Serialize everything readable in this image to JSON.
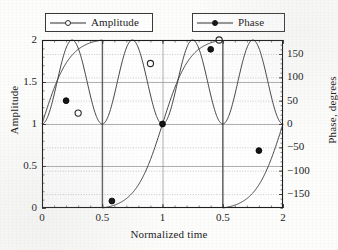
{
  "legend": {
    "items": [
      {
        "label": "Amplitude",
        "marker": "open-circle-marker",
        "color": "#2f2f2f"
      },
      {
        "label": "Phase",
        "marker": "filled-circle-marker",
        "color": "#151515"
      }
    ]
  },
  "axes": {
    "x": {
      "title": "Normalized time",
      "ticks": [
        {
          "value": 0,
          "label": "0"
        },
        {
          "value": 0.5,
          "label": "0.5"
        },
        {
          "value": 1,
          "label": "1"
        },
        {
          "value": 1.5,
          "label": "0.5"
        },
        {
          "value": 2,
          "label": "2"
        }
      ]
    },
    "y_left": {
      "title": "Amplitude",
      "ticks": [
        {
          "value": 0,
          "label": "0"
        },
        {
          "value": 0.5,
          "label": "0.5"
        },
        {
          "value": 1,
          "label": "1"
        },
        {
          "value": 1.5,
          "label": "1.5"
        },
        {
          "value": 2,
          "label": "2"
        }
      ]
    },
    "y_right": {
      "title": "Phase, degrees",
      "ticks": [
        {
          "value": -150,
          "label": "−150"
        },
        {
          "value": -100,
          "label": "−100"
        },
        {
          "value": -50,
          "label": "−50"
        },
        {
          "value": 0,
          "label": "0"
        },
        {
          "value": 50,
          "label": "50"
        },
        {
          "value": 100,
          "label": "100"
        },
        {
          "value": 150,
          "label": "150"
        }
      ]
    }
  },
  "chart_data": {
    "type": "line",
    "title": "",
    "subtitle": "",
    "xlabel": "Normalized time",
    "ylabel": "Amplitude",
    "y2label": "Phase, degrees",
    "xlim": [
      0,
      2
    ],
    "ylim": [
      0,
      2
    ],
    "y2lim": [
      -180,
      180
    ],
    "grid": true,
    "legend_position": "above-plot",
    "xticks": [
      0,
      0.5,
      1,
      1.5,
      2
    ],
    "xticklabels": [
      "0",
      "0.5",
      "1",
      "0.5",
      "2"
    ],
    "yticks": [
      0,
      0.5,
      1,
      1.5,
      2
    ],
    "yticklabels": [
      "0",
      "0.5",
      "1",
      "1.5",
      "2"
    ],
    "y2ticks": [
      -150,
      -100,
      -50,
      0,
      50,
      100,
      150
    ],
    "y2ticklabels": [
      "−150",
      "−100",
      "−50",
      "0",
      "50",
      "100",
      "150"
    ],
    "series": [
      {
        "name": "Amplitude",
        "axis": "left",
        "marker": "open-circle",
        "description": "Oscillating magnitude, period 0.5, ranging 1 to 2; equals 2 at t = 0.5, 1.0, 1.5, 2.0 and 1 at t = 0, 0.25, 0.75, 1.25, 1.75",
        "marker_points": [
          {
            "x": 0.3,
            "y": 1.13
          },
          {
            "x": 0.9,
            "y": 1.72
          },
          {
            "x": 1.47,
            "y": 2.0
          }
        ],
        "x": [
          0,
          0.05,
          0.1,
          0.15,
          0.2,
          0.25,
          0.3,
          0.35,
          0.4,
          0.45,
          0.5,
          0.55,
          0.6,
          0.65,
          0.7,
          0.75,
          0.8,
          0.85,
          0.9,
          0.95,
          1,
          1.05,
          1.1,
          1.15,
          1.2,
          1.25,
          1.3,
          1.35,
          1.4,
          1.45,
          1.5,
          1.55,
          1.6,
          1.65,
          1.7,
          1.75,
          1.8,
          1.85,
          1.9,
          1.95,
          2
        ],
        "y": [
          1.0,
          1.05,
          1.19,
          1.41,
          1.69,
          1.0,
          1.13,
          1.32,
          1.56,
          1.8,
          2.0,
          1.8,
          1.56,
          1.32,
          1.13,
          1.0,
          1.13,
          1.41,
          1.72,
          1.93,
          2.0,
          1.93,
          1.72,
          1.41,
          1.13,
          1.0,
          1.13,
          1.41,
          1.72,
          1.93,
          2.0,
          1.93,
          1.72,
          1.41,
          1.13,
          1.0,
          1.13,
          1.41,
          1.72,
          1.93,
          2.0
        ]
      },
      {
        "name": "Phase",
        "axis": "right",
        "marker": "filled-circle",
        "description": "Wrapped phase sawtooth; rises from about 0 degrees at t = 0 to +180 at t = 0.5, wraps to -180 and rises to +180 at t = 1.5, wraps again and rises toward 0 at t = 2",
        "marker_points": [
          {
            "x": 0.2,
            "y": 50
          },
          {
            "x": 0.58,
            "y": -165
          },
          {
            "x": 1.0,
            "y": 0
          },
          {
            "x": 1.4,
            "y": 160
          },
          {
            "x": 1.8,
            "y": -57
          }
        ],
        "x": [
          0,
          0.1,
          0.2,
          0.3,
          0.4,
          0.5,
          0.5,
          0.6,
          0.7,
          0.8,
          0.9,
          1,
          1.1,
          1.2,
          1.3,
          1.4,
          1.5,
          1.5,
          1.6,
          1.7,
          1.8,
          1.9,
          2
        ],
        "y": [
          0,
          22,
          50,
          90,
          138,
          180,
          -180,
          -158,
          -118,
          -70,
          -30,
          0,
          30,
          70,
          118,
          160,
          180,
          -180,
          -158,
          -118,
          -57,
          -25,
          0
        ]
      }
    ]
  }
}
